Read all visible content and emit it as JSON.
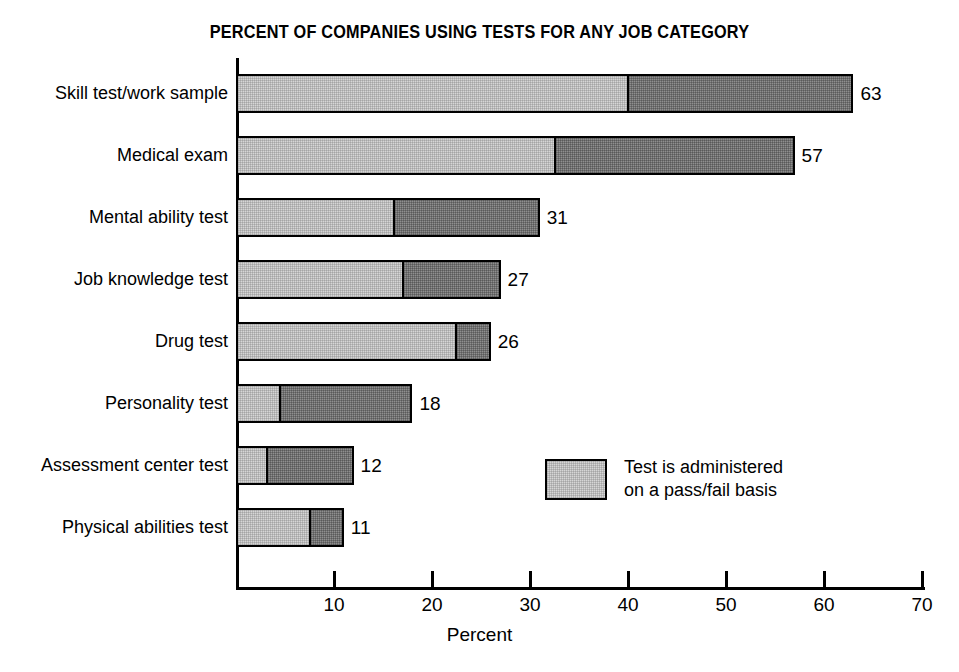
{
  "chart_data": {
    "type": "bar",
    "orientation": "horizontal",
    "stacked": true,
    "title": "PERCENT OF COMPANIES USING TESTS FOR ANY JOB CATEGORY",
    "xlabel": "Percent",
    "ylabel": "",
    "xlim": [
      0,
      70
    ],
    "xticks": [
      10,
      20,
      30,
      40,
      50,
      60,
      70
    ],
    "xtick_labels": [
      "10",
      "20",
      "30",
      "40",
      "50",
      "60",
      "70"
    ],
    "grid": false,
    "legend_position": "inside-right",
    "categories": [
      "Skill test/work sample",
      "Medical exam",
      "Mental ability test",
      "Job knowledge test",
      "Drug test",
      "Personality test",
      "Assessment center test",
      "Physical abilities test"
    ],
    "totals": [
      63,
      57,
      31,
      27,
      26,
      18,
      12,
      11
    ],
    "value_labels": [
      "63",
      "57",
      "31",
      "27",
      "26",
      "18",
      "12",
      "11"
    ],
    "series": [
      {
        "name": "Test is administered on a pass/fail basis",
        "fill": "light-halftone",
        "color": "#d6d6d6",
        "values": [
          40,
          32.5,
          16,
          17,
          22.5,
          4.3,
          3,
          7.5
        ]
      },
      {
        "name": "Not administered on a pass/fail basis",
        "fill": "dark-halftone",
        "color": "#8f8f8f",
        "values": [
          23,
          24.5,
          15,
          10,
          3.5,
          13.7,
          9,
          3.5
        ]
      }
    ]
  },
  "legend": {
    "swatch_color": "#d6d6d6",
    "label": "Test is administered\non a pass/fail basis"
  },
  "colors": {
    "light_segment": "#d6d6d6",
    "dark_segment": "#8f8f8f",
    "outline": "#000000",
    "background": "#ffffff"
  }
}
